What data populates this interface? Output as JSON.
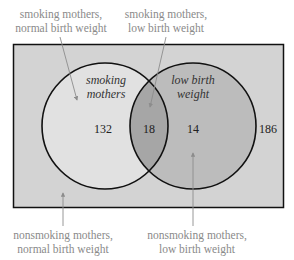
{
  "diagram": {
    "type": "venn",
    "sets": [
      {
        "name": "smoking mothers",
        "label_line1": "smoking",
        "label_line2": "mothers"
      },
      {
        "name": "low birth weight",
        "label_line1": "low birth",
        "label_line2": "weight"
      }
    ],
    "regions": {
      "smoking_only": "132",
      "both": "18",
      "low_birth_weight_only": "14",
      "neither": "186"
    },
    "callouts": {
      "top_left": {
        "line1": "smoking mothers,",
        "line2": "normal birth weight"
      },
      "top_right": {
        "line1": "smoking mothers,",
        "line2": "low birth weight"
      },
      "bottom_left": {
        "line1": "nonsmoking mothers,",
        "line2": "normal birth weight"
      },
      "bottom_right": {
        "line1": "nonsmoking mothers,",
        "line2": "low birth weight"
      }
    },
    "colors": {
      "universe": "#d3d3d3",
      "left_circle": "#e1e1e1",
      "right_circle": "#bcbcbc",
      "intersection": "#a6a6a6",
      "outline": "#111111",
      "callout_text": "#8a8a8a",
      "leader_line": "#8c8c8c"
    }
  }
}
